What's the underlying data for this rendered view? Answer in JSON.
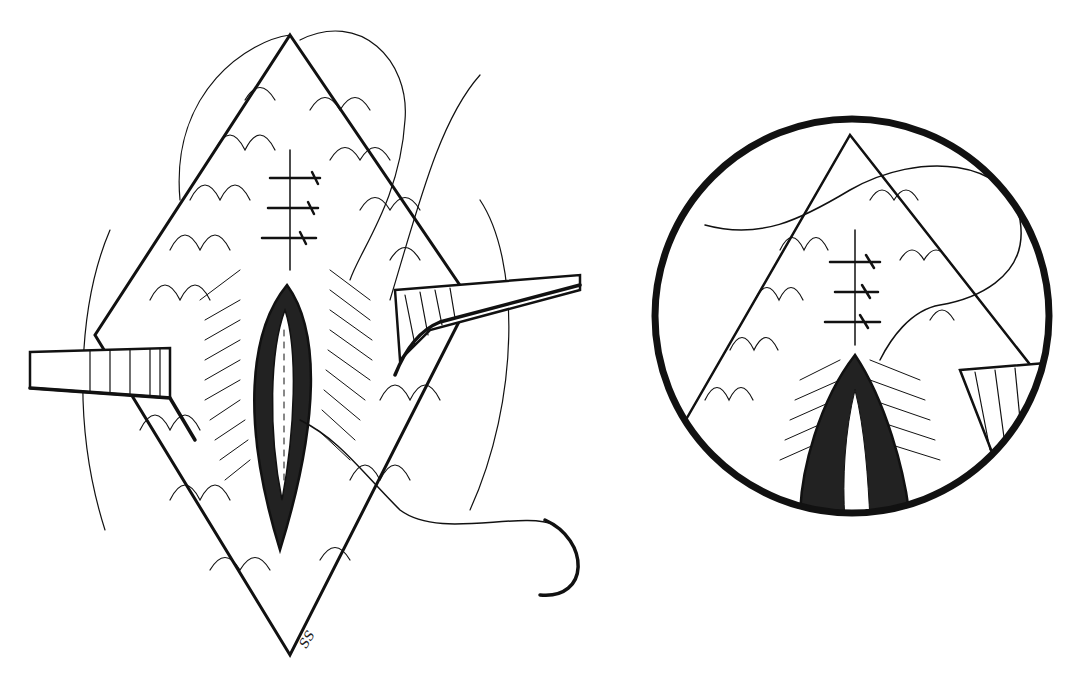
{
  "illustration": {
    "type": "surgical line drawing",
    "style": "black ink on white",
    "colors": {
      "ink": "#111111",
      "background": "#ffffff"
    },
    "panels": [
      {
        "name": "main-view",
        "description": "Diamond-shaped incision held open by two retractors, showing layered sutures at upper apex, deep opening in center, curved suture needle at lower right"
      },
      {
        "name": "inset-detail",
        "description": "Circular magnified inset of the upper apex of the incision showing interrupted sutures and threaded suture"
      }
    ],
    "signature": "SS"
  }
}
